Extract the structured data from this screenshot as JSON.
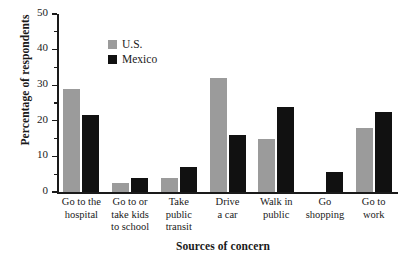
{
  "chart_data": {
    "type": "bar",
    "title": "",
    "xlabel": "Sources of concern",
    "ylabel": "Percentage of respondents",
    "ylim": [
      0,
      50
    ],
    "yticks": [
      0,
      10,
      20,
      30,
      40,
      50
    ],
    "ytick_labels": [
      "0",
      "10",
      "20",
      "30",
      "40",
      "50"
    ],
    "minor_tick_step": 5,
    "grid": false,
    "legend_position": "upper-left-inside",
    "categories": [
      "Go to the hospital",
      "Go to or take kids to school",
      "Take public transit",
      "Drive a car",
      "Walk in public",
      "Go shopping",
      "Go to work"
    ],
    "category_lines": [
      [
        "Go to the",
        "hospital"
      ],
      [
        "Go to or",
        "take kids",
        "to school"
      ],
      [
        "Take",
        "public",
        "transit"
      ],
      [
        "Drive",
        "a car"
      ],
      [
        "Walk in",
        "public"
      ],
      [
        "Go",
        "shopping"
      ],
      [
        "Go to",
        "work"
      ]
    ],
    "series": [
      {
        "name": "U.S.",
        "color": "#9b9b9b",
        "values": [
          29,
          2.5,
          4,
          32,
          15,
          0,
          18
        ]
      },
      {
        "name": "Mexico",
        "color": "#111111",
        "values": [
          21.5,
          4,
          7,
          16,
          24,
          5.5,
          22.5
        ]
      }
    ]
  },
  "legend": {
    "items": [
      {
        "label": "U.S.",
        "swatch": "gray-swatch-icon"
      },
      {
        "label": "Mexico",
        "swatch": "black-swatch-icon"
      }
    ]
  },
  "colors": {
    "us": "#9b9b9b",
    "mexico": "#111111",
    "axis": "#1a1a1a",
    "background": "#ffffff"
  }
}
